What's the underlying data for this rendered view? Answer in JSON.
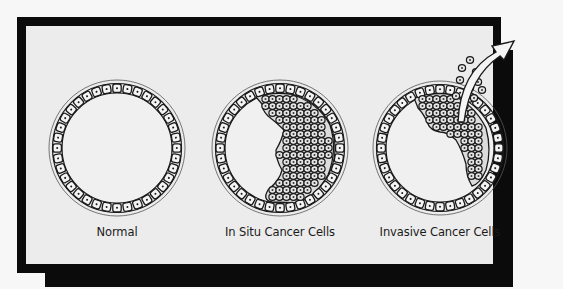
{
  "figure": {
    "panels": [
      {
        "id": "normal",
        "label": "Normal",
        "center_x": 117
      },
      {
        "id": "in-situ",
        "label": "In Situ Cancer Cells",
        "center_x": 280
      },
      {
        "id": "invasive",
        "label": "Invasive Cancer Cells",
        "center_x": 440
      }
    ],
    "colors": {
      "frame": "#0b0b0b",
      "panel_background": "#ececec",
      "cell_outline": "#1a1a1a",
      "cell_fill": "#f4f4f4"
    }
  }
}
